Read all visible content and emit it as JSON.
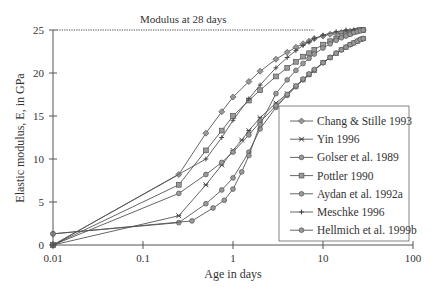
{
  "chart_data": {
    "type": "line",
    "title": "",
    "annotation": "Modulus at 28 days",
    "xlabel": "Age in days",
    "ylabel": "Elastic modulus, E, in GPa",
    "xscale": "log",
    "xlim": [
      0.01,
      100
    ],
    "ylim": [
      0,
      25
    ],
    "xticks": [
      "0.01",
      "0.1",
      "1",
      "10",
      "100"
    ],
    "yticks": [
      "0",
      "5",
      "10",
      "15",
      "20",
      "25"
    ],
    "reference_line": {
      "y": 25,
      "x_from": 0.01,
      "x_to": 8,
      "style": "dotted"
    },
    "legend_position": "lower right (inside)",
    "series": [
      {
        "name": "Chang & Stille 1993",
        "marker": "diamond",
        "x": [
          0.01,
          0.25,
          0.5,
          0.75,
          1,
          1.5,
          2,
          3,
          4,
          5,
          6,
          7,
          8,
          10,
          12,
          14,
          16,
          18,
          20,
          22,
          24,
          26,
          28
        ],
        "y": [
          0,
          8.2,
          13,
          15.5,
          17.2,
          19,
          20.2,
          21.6,
          22.4,
          23,
          23.4,
          23.7,
          24,
          24.3,
          24.5,
          24.6,
          24.7,
          24.8,
          24.85,
          24.9,
          24.95,
          25,
          25
        ]
      },
      {
        "name": "Yin 1996",
        "marker": "x-star",
        "x": [
          0.01,
          0.25,
          0.5,
          0.75,
          1,
          1.25,
          1.5,
          2,
          3,
          4,
          5,
          6,
          7,
          8,
          10,
          12,
          14,
          16,
          18,
          20,
          22,
          24,
          26,
          28
        ],
        "y": [
          0,
          3.4,
          7,
          9.3,
          11,
          12.2,
          13.3,
          14.8,
          16.5,
          17.6,
          18.5,
          19.2,
          19.8,
          20.3,
          21.2,
          21.8,
          22.3,
          22.7,
          23,
          23.3,
          23.5,
          23.7,
          23.9,
          24
        ]
      },
      {
        "name": "Golser et al. 1989",
        "marker": "circle",
        "x": [
          0.01,
          0.25,
          0.5,
          0.75,
          1,
          1.5,
          2,
          3,
          4,
          5,
          6,
          7,
          8,
          10,
          12,
          14,
          16,
          18,
          20,
          22,
          24,
          26,
          28
        ],
        "y": [
          1.3,
          2.6,
          4.8,
          6.4,
          7.8,
          10.8,
          13.5,
          16,
          17.4,
          18.4,
          19.2,
          19.8,
          20.3,
          21.2,
          21.8,
          22.3,
          22.7,
          23,
          23.3,
          23.5,
          23.7,
          23.9,
          24
        ]
      },
      {
        "name": "Pottler 1990",
        "marker": "square",
        "x": [
          0.01,
          0.25,
          0.5,
          0.75,
          1,
          1.5,
          2,
          3,
          4,
          5,
          6,
          7,
          8,
          10,
          12,
          14,
          16,
          18,
          20,
          22,
          24,
          26,
          28
        ],
        "y": [
          0,
          7,
          11,
          13.3,
          15,
          16.8,
          18,
          19.6,
          20.6,
          21.3,
          21.9,
          22.3,
          22.7,
          23.3,
          23.7,
          24,
          24.3,
          24.5,
          24.6,
          24.8,
          24.9,
          25,
          25
        ]
      },
      {
        "name": "Aydan et al. 1992a",
        "marker": "hexagon",
        "x": [
          0.01,
          0.25,
          0.5,
          0.75,
          1,
          1.5,
          2,
          3,
          4,
          5,
          6,
          7,
          8,
          10,
          12,
          14,
          16,
          18,
          20,
          22,
          24,
          26,
          28
        ],
        "y": [
          0,
          6,
          8.2,
          9.6,
          10.8,
          12.8,
          14.3,
          16.2,
          17.5,
          18.5,
          19.3,
          19.9,
          20.4,
          21.2,
          21.8,
          22.3,
          22.7,
          23,
          23.3,
          23.5,
          23.7,
          23.9,
          24
        ]
      },
      {
        "name": "Meschke 1996",
        "marker": "plus",
        "x": [
          0.01,
          0.5,
          0.75,
          1,
          1.5,
          2,
          3,
          4,
          5,
          6,
          7,
          8,
          10,
          14,
          18,
          22,
          28
        ],
        "y": [
          0,
          10,
          12.5,
          14.5,
          17,
          18.6,
          20.6,
          21.8,
          22.6,
          23.2,
          23.6,
          24,
          24.4,
          24.8,
          25,
          25,
          25
        ]
      },
      {
        "name": "Hellmich et al. 1999b",
        "marker": "octagon",
        "x": [
          0.01,
          0.35,
          0.6,
          0.8,
          1,
          1.25,
          1.5,
          2,
          3,
          4,
          5,
          6,
          7,
          8,
          10,
          12,
          14,
          16,
          18,
          20,
          22,
          24,
          26,
          28
        ],
        "y": [
          1.3,
          2.8,
          4.3,
          5.2,
          6.5,
          8.5,
          10.4,
          14,
          17.6,
          19.2,
          20.3,
          21.1,
          21.7,
          22.2,
          22.9,
          23.4,
          23.8,
          24.1,
          24.3,
          24.5,
          24.7,
          24.8,
          24.9,
          25
        ]
      }
    ]
  }
}
